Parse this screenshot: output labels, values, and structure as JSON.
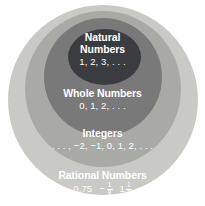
{
  "diagram": {
    "type": "nested-sets",
    "background_color": "#ffffff",
    "sets": [
      {
        "id": "rational",
        "name": "Rational Numbers",
        "values_text": "0.75  − 1/8   1 1/2",
        "color": "#c9cac6",
        "level": 1,
        "values_parts": {
          "decimal": "0.75",
          "neg_sign": "−",
          "frac1_num": "1",
          "frac1_den": "8",
          "mixed_whole": "1",
          "frac2_num": "1",
          "frac2_den": "2"
        }
      },
      {
        "id": "integers",
        "name": "Integers",
        "values_text": ". . . , −2, −1, 0, 1, 2, . . .",
        "color": "#a9aaa6",
        "level": 2
      },
      {
        "id": "whole",
        "name": "Whole Numbers",
        "values_text": "0, 1, 2, . . .",
        "color": "#79797a",
        "level": 3
      },
      {
        "id": "natural",
        "name_line1": "Natural",
        "name_line2": "Numbers",
        "name": "Natural Numbers",
        "values_text": "1, 2, 3, . . .",
        "color": "#3b3c40",
        "level": 4
      }
    ]
  }
}
